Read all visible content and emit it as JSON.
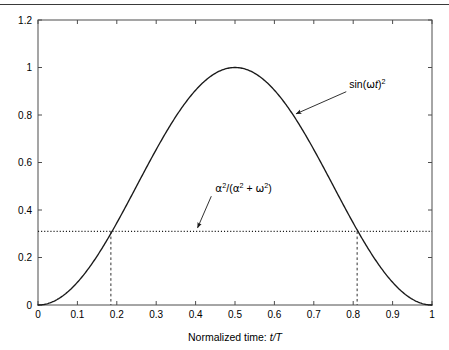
{
  "figure": {
    "top_rule": true,
    "background_color": "#ffffff",
    "axis_color": "#4d4d4d",
    "curve_color": "#1a1a1a"
  },
  "chart_data": {
    "type": "line",
    "title": "",
    "subtitle": "",
    "xlabel_prefix": "Normalized time: ",
    "xlabel_symbol": "t/T",
    "ylabel": "",
    "xlim": [
      0,
      1
    ],
    "ylim": [
      0,
      1.2
    ],
    "grid": false,
    "legend_position": "none",
    "xticks": [
      0,
      0.1,
      0.2,
      0.3,
      0.4,
      0.5,
      0.6,
      0.7,
      0.8,
      0.9,
      1
    ],
    "xtick_labels": [
      "0",
      "0.1",
      "0.2",
      "0.3",
      "0.4",
      "0.5",
      "0.6",
      "0.7",
      "0.8",
      "0.9",
      "1"
    ],
    "yticks": [
      0,
      0.2,
      0.4,
      0.6,
      0.8,
      1,
      1.2
    ],
    "ytick_labels": [
      "0",
      "0.2",
      "0.4",
      "0.6",
      "0.8",
      "1",
      "1.2"
    ],
    "series": [
      {
        "name": "sin(wt)^2",
        "style": "solid",
        "x": [
          0,
          0.02,
          0.04,
          0.06,
          0.08,
          0.1,
          0.12,
          0.14,
          0.16,
          0.18,
          0.2,
          0.22,
          0.24,
          0.26,
          0.28,
          0.3,
          0.32,
          0.34,
          0.36,
          0.38,
          0.4,
          0.42,
          0.44,
          0.46,
          0.48,
          0.5,
          0.52,
          0.54,
          0.56,
          0.58,
          0.6,
          0.62,
          0.64,
          0.66,
          0.68,
          0.7,
          0.72,
          0.74,
          0.76,
          0.78,
          0.8,
          0.82,
          0.84,
          0.86,
          0.88,
          0.9,
          0.92,
          0.94,
          0.96,
          0.98,
          1
        ],
        "values": [
          0,
          0.0039,
          0.0155,
          0.0345,
          0.0605,
          0.0955,
          0.1305,
          0.1729,
          0.2191,
          0.268,
          0.3455,
          0.397,
          0.4505,
          0.505,
          0.559,
          0.6545,
          0.7029,
          0.7483,
          0.7902,
          0.8282,
          0.9045,
          0.9308,
          0.9523,
          0.9685,
          0.9794,
          1.0,
          0.9794,
          0.9685,
          0.9523,
          0.9308,
          0.9045,
          0.8282,
          0.7902,
          0.7483,
          0.7029,
          0.6545,
          0.559,
          0.505,
          0.4505,
          0.397,
          0.3455,
          0.268,
          0.2191,
          0.1729,
          0.1305,
          0.0955,
          0.0605,
          0.0345,
          0.0155,
          0.0039,
          0
        ]
      },
      {
        "name": "alpha^2/(alpha^2 + omega^2)",
        "style": "dotted",
        "constant_y": 0.31,
        "x": [
          0,
          1
        ]
      }
    ],
    "vertical_markers": {
      "style": "dashed",
      "x": [
        0.185,
        0.81
      ],
      "y_top": 0.31,
      "y_bottom": 0
    },
    "annotations": [
      {
        "id": "curve-annotation",
        "text_parts": {
          "base": "sin(",
          "greek": "ω",
          "var": "t",
          "close": ")",
          "sup": "2"
        },
        "text_plain": "sin(ωt)²",
        "label_x": 0.79,
        "label_y": 0.915,
        "arrow_to_x": 0.655,
        "arrow_to_y": 0.805
      },
      {
        "id": "threshold-annotation",
        "text_parts": {
          "a": "α",
          "sup1": "2",
          "slash": "/(",
          "b": "α",
          "sup2": "2",
          "plus": " + ",
          "w": "ω",
          "sup3": "2",
          "close": ")"
        },
        "text_plain": "α²/(α² + ω²)",
        "label_x": 0.45,
        "label_y": 0.475,
        "arrow_to_x": 0.405,
        "arrow_to_y": 0.325
      }
    ]
  }
}
